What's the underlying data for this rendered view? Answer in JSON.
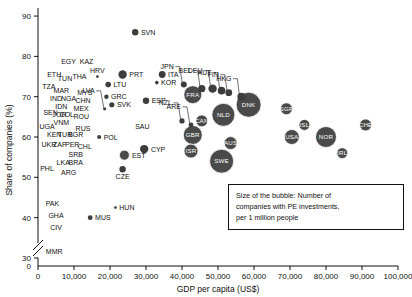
{
  "chart_data": {
    "type": "scatter",
    "title": "",
    "xlabel": "GDP per capita (US$)",
    "ylabel": "Share of companies (%)",
    "xlim": [
      0,
      100000
    ],
    "ylim": [
      28,
      92
    ],
    "xticks": [
      "0",
      "10,000",
      "20,000",
      "30,000",
      "40,000",
      "50,000",
      "60,000",
      "70,000",
      "80,000",
      "90,000",
      "100,000"
    ],
    "yticks": [
      "30",
      "40",
      "50",
      "60",
      "70",
      "80",
      "90"
    ],
    "grid": false,
    "axis_break_y": true,
    "size_meaning": "Number of companies with PE investments, per 1 million people",
    "points": [
      {
        "code": "SVN",
        "x": 27000,
        "y": 86,
        "r": 3.2,
        "label": "outside-right"
      },
      {
        "code": "PRT",
        "x": 23500,
        "y": 75.5,
        "r": 4.2,
        "label": "outside-right"
      },
      {
        "code": "ITA",
        "x": 34500,
        "y": 75.5,
        "r": 3.4,
        "label": "outside-right"
      },
      {
        "code": "KOR",
        "x": 33000,
        "y": 73.5,
        "r": 1.8,
        "label": "outside-right"
      },
      {
        "code": "JPN",
        "x": 40500,
        "y": 73,
        "r": 3.0,
        "label": "leader"
      },
      {
        "code": "BEL",
        "x": 45500,
        "y": 72,
        "r": 3.6,
        "label": "leader"
      },
      {
        "code": "FRA",
        "x": 43000,
        "y": 70.5,
        "r": 9.0,
        "label": "inside"
      },
      {
        "code": "DEU",
        "x": 48500,
        "y": 72,
        "r": 4.2,
        "label": "leader"
      },
      {
        "code": "AUT",
        "x": 51000,
        "y": 71.5,
        "r": 3.8,
        "label": "leader"
      },
      {
        "code": "FIN",
        "x": 53000,
        "y": 71,
        "r": 3.4,
        "label": "leader"
      },
      {
        "code": "HKG",
        "x": 56500,
        "y": 70,
        "r": 4.0,
        "label": "leader"
      },
      {
        "code": "DNK",
        "x": 58500,
        "y": 68,
        "r": 12.5,
        "label": "inside"
      },
      {
        "code": "SGP",
        "x": 69000,
        "y": 67,
        "r": 6.0,
        "label": "inside"
      },
      {
        "code": "NLD",
        "x": 51500,
        "y": 65.5,
        "r": 11.5,
        "label": "inside"
      },
      {
        "code": "CAN",
        "x": 45500,
        "y": 64,
        "r": 6.0,
        "label": "inside"
      },
      {
        "code": "NZL",
        "x": 40000,
        "y": 64,
        "r": 2.6,
        "label": "leader"
      },
      {
        "code": "ARE",
        "x": 42500,
        "y": 63,
        "r": 2.4,
        "label": "leader"
      },
      {
        "code": "GBR",
        "x": 43000,
        "y": 60.5,
        "r": 9.5,
        "label": "inside"
      },
      {
        "code": "ISR",
        "x": 42500,
        "y": 56.5,
        "r": 7.0,
        "label": "inside"
      },
      {
        "code": "AUS",
        "x": 53500,
        "y": 58.5,
        "r": 6.5,
        "label": "inside"
      },
      {
        "code": "SWE",
        "x": 51000,
        "y": 54,
        "r": 12.0,
        "label": "inside"
      },
      {
        "code": "ISL",
        "x": 74000,
        "y": 63,
        "r": 5.5,
        "label": "inside"
      },
      {
        "code": "USA",
        "x": 70500,
        "y": 60,
        "r": 7.5,
        "label": "inside"
      },
      {
        "code": "NOR",
        "x": 80000,
        "y": 60,
        "r": 10.5,
        "label": "inside"
      },
      {
        "code": "IRL",
        "x": 84500,
        "y": 56,
        "r": 5.5,
        "label": "inside"
      },
      {
        "code": "CHE",
        "x": 91000,
        "y": 63,
        "r": 6.0,
        "label": "inside"
      },
      {
        "code": "ESP",
        "x": 30000,
        "y": 69,
        "r": 3.2,
        "label": "outside-right"
      },
      {
        "code": "CYP",
        "x": 29500,
        "y": 57,
        "r": 4.2,
        "label": "outside-right"
      },
      {
        "code": "EST",
        "x": 24000,
        "y": 55.5,
        "r": 5.0,
        "label": "outside-right"
      },
      {
        "code": "CZE",
        "x": 23500,
        "y": 52,
        "r": 3.2,
        "label": "outside-below"
      },
      {
        "code": "LTU",
        "x": 19500,
        "y": 73,
        "r": 2.8,
        "label": "outside-right"
      },
      {
        "code": "GRC",
        "x": 19000,
        "y": 70,
        "r": 2.2,
        "label": "outside-right"
      },
      {
        "code": "SVK",
        "x": 20500,
        "y": 68,
        "r": 2.6,
        "label": "outside-right"
      },
      {
        "code": "LVA",
        "x": 18500,
        "y": 67,
        "r": 1.6,
        "label": "leader"
      },
      {
        "code": "HRV",
        "x": 16500,
        "y": 75,
        "r": 1.4,
        "label": "outside-above"
      },
      {
        "code": "POL",
        "x": 17000,
        "y": 60,
        "r": 2.0,
        "label": "outside-right"
      },
      {
        "code": "HUN",
        "x": 21500,
        "y": 42.5,
        "r": 1.4,
        "label": "outside-right"
      },
      {
        "code": "MUS",
        "x": 14500,
        "y": 40,
        "r": 2.4,
        "label": "outside-right"
      },
      {
        "code": "SAU",
        "x": 29000,
        "y": 62,
        "r": 0,
        "label": "text-only"
      },
      {
        "code": "EGY",
        "x": 8500,
        "y": 78,
        "r": 0,
        "label": "text-only"
      },
      {
        "code": "KAZ",
        "x": 13500,
        "y": 78,
        "r": 0,
        "label": "text-only"
      },
      {
        "code": "ETH",
        "x": 4500,
        "y": 75,
        "r": 0,
        "label": "text-only"
      },
      {
        "code": "TUN",
        "x": 7500,
        "y": 74,
        "r": 0,
        "label": "text-only"
      },
      {
        "code": "THA",
        "x": 11500,
        "y": 74.5,
        "r": 0,
        "label": "text-only"
      },
      {
        "code": "TZA",
        "x": 3000,
        "y": 72,
        "r": 0,
        "label": "text-only"
      },
      {
        "code": "MAR",
        "x": 6500,
        "y": 71,
        "r": 0,
        "label": "text-only"
      },
      {
        "code": "MYS",
        "x": 13000,
        "y": 70.5,
        "r": 0,
        "label": "text-only"
      },
      {
        "code": "IND",
        "x": 5000,
        "y": 69,
        "r": 0,
        "label": "text-only"
      },
      {
        "code": "NGA",
        "x": 8500,
        "y": 69,
        "r": 0,
        "label": "text-only"
      },
      {
        "code": "CHN",
        "x": 12500,
        "y": 68.5,
        "r": 0,
        "label": "text-only"
      },
      {
        "code": "MEX",
        "x": 12000,
        "y": 66.5,
        "r": 0,
        "label": "text-only"
      },
      {
        "code": "IDN",
        "x": 6500,
        "y": 67,
        "r": 0,
        "label": "text-only"
      },
      {
        "code": "SEN",
        "x": 3500,
        "y": 65.5,
        "r": 0,
        "label": "text-only"
      },
      {
        "code": "JOR",
        "x": 6000,
        "y": 65,
        "r": 0,
        "label": "text-only"
      },
      {
        "code": "COL",
        "x": 8000,
        "y": 65,
        "r": 0,
        "label": "text-only"
      },
      {
        "code": "ROU",
        "x": 12000,
        "y": 64.5,
        "r": 0,
        "label": "text-only"
      },
      {
        "code": "VNM",
        "x": 6500,
        "y": 63,
        "r": 0,
        "label": "text-only"
      },
      {
        "code": "UGA",
        "x": 2500,
        "y": 62,
        "r": 0,
        "label": "text-only"
      },
      {
        "code": "RUS",
        "x": 12500,
        "y": 61.5,
        "r": 0,
        "label": "text-only"
      },
      {
        "code": "KEN",
        "x": 4500,
        "y": 60,
        "r": 0,
        "label": "text-only"
      },
      {
        "code": "TUR",
        "x": 7500,
        "y": 60,
        "r": 0,
        "label": "text-only"
      },
      {
        "code": "BGR",
        "x": 10500,
        "y": 60,
        "r": 0,
        "label": "text-only"
      },
      {
        "code": "UKR",
        "x": 3000,
        "y": 57.5,
        "r": 0,
        "label": "text-only"
      },
      {
        "code": "ZAF",
        "x": 6000,
        "y": 57.5,
        "r": 0,
        "label": "text-only"
      },
      {
        "code": "PER",
        "x": 9500,
        "y": 57.5,
        "r": 0,
        "label": "text-only"
      },
      {
        "code": "CHL",
        "x": 13000,
        "y": 57,
        "r": 0,
        "label": "text-only"
      },
      {
        "code": "SRB",
        "x": 10500,
        "y": 55,
        "r": 0,
        "label": "text-only"
      },
      {
        "code": "BRA",
        "x": 10500,
        "y": 53,
        "r": 0,
        "label": "text-only"
      },
      {
        "code": "LKA",
        "x": 7000,
        "y": 53,
        "r": 0,
        "label": "text-only"
      },
      {
        "code": "PHL",
        "x": 2500,
        "y": 51.5,
        "r": 0,
        "label": "text-only"
      },
      {
        "code": "ARG",
        "x": 8500,
        "y": 50.5,
        "r": 0,
        "label": "text-only"
      },
      {
        "code": "PAK",
        "x": 4000,
        "y": 43,
        "r": 0,
        "label": "text-only"
      },
      {
        "code": "GHA",
        "x": 5000,
        "y": 40,
        "r": 0,
        "label": "text-only"
      },
      {
        "code": "CIV",
        "x": 5000,
        "y": 37,
        "r": 0,
        "label": "text-only"
      },
      {
        "code": "MMR",
        "x": 4500,
        "y": 31,
        "r": 0,
        "label": "text-only"
      }
    ]
  },
  "legend": {
    "line1": "Size of the bubble: Number of",
    "line2": "companies with PE investments,",
    "line3": "per 1 million people"
  }
}
